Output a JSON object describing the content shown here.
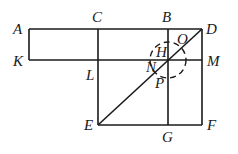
{
  "diagram": {
    "type": "geometric-figure",
    "points": {
      "A": {
        "label": "A",
        "x": 29,
        "y": 29
      },
      "C": {
        "label": "C",
        "x": 98,
        "y": 29
      },
      "B": {
        "label": "B",
        "x": 168,
        "y": 29
      },
      "D": {
        "label": "D",
        "x": 202,
        "y": 29
      },
      "K": {
        "label": "K",
        "x": 29,
        "y": 60
      },
      "L": {
        "label": "L",
        "x": 98,
        "y": 60
      },
      "H": {
        "label": "H",
        "x": 168,
        "y": 60
      },
      "M": {
        "label": "M",
        "x": 202,
        "y": 60
      },
      "E": {
        "label": "E",
        "x": 98,
        "y": 125
      },
      "G": {
        "label": "G",
        "x": 168,
        "y": 125
      },
      "F": {
        "label": "F",
        "x": 202,
        "y": 125
      },
      "N": {
        "label": "N"
      },
      "O": {
        "label": "O"
      },
      "P": {
        "label": "P"
      }
    },
    "segments": [
      "AD",
      "KM",
      "AK",
      "CE",
      "BG",
      "DF",
      "EF",
      "ED"
    ],
    "dashed_circle": {
      "center": "H",
      "radius": 18
    }
  }
}
